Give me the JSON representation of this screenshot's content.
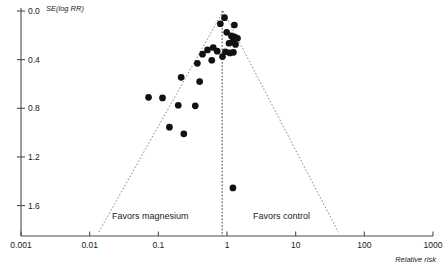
{
  "chart_data": {
    "type": "scatter",
    "title": "",
    "subtitle": "",
    "xlabel": "Relative risk",
    "ylabel": "SE(log RR)",
    "x_scale": "log",
    "xlim": [
      0.001,
      1000
    ],
    "ylim": [
      0.0,
      1.85
    ],
    "y_inverted": true,
    "grid": false,
    "legend": "none",
    "x_ticks": [
      {
        "value": 0.001,
        "label": "0.001"
      },
      {
        "value": 0.01,
        "label": "0.01"
      },
      {
        "value": 0.1,
        "label": "0.1"
      },
      {
        "value": 1,
        "label": "1"
      },
      {
        "value": 10,
        "label": "10"
      },
      {
        "value": 100,
        "label": "100"
      },
      {
        "value": 1000,
        "label": "1000"
      }
    ],
    "y_ticks": [
      {
        "value": 0.0,
        "label": "0.0"
      },
      {
        "value": 0.4,
        "label": "0.4"
      },
      {
        "value": 0.8,
        "label": "0.8"
      },
      {
        "value": 1.2,
        "label": "1.2"
      },
      {
        "value": 1.6,
        "label": "1.6"
      }
    ],
    "reference_line": {
      "name": "pooled-effect-line",
      "x": 0.85,
      "style": "dashed"
    },
    "funnel": {
      "apex_x": 0.88,
      "apex_y": 0.0,
      "left_base_x": 0.0135,
      "right_base_x": 42.0,
      "base_y": 1.82,
      "style": "dotted"
    },
    "annotations": [
      {
        "name": "favors-magnesium-label",
        "text": "Favors magnesium",
        "x_px": 112,
        "y_px": 219
      },
      {
        "name": "favors-control-label",
        "text": "Favors control",
        "x_px": 253,
        "y_px": 219
      }
    ],
    "series": [
      {
        "name": "studies",
        "marker": "filled-circle",
        "color": "#111111",
        "points": [
          {
            "x": 0.92,
            "y": 0.055
          },
          {
            "x": 0.8,
            "y": 0.105
          },
          {
            "x": 1.28,
            "y": 0.115
          },
          {
            "x": 0.99,
            "y": 0.175
          },
          {
            "x": 1.16,
            "y": 0.205
          },
          {
            "x": 1.3,
            "y": 0.215
          },
          {
            "x": 1.42,
            "y": 0.225
          },
          {
            "x": 1.2,
            "y": 0.255
          },
          {
            "x": 1.07,
            "y": 0.265
          },
          {
            "x": 1.33,
            "y": 0.275
          },
          {
            "x": 0.63,
            "y": 0.3
          },
          {
            "x": 0.52,
            "y": 0.32
          },
          {
            "x": 0.72,
            "y": 0.33
          },
          {
            "x": 0.95,
            "y": 0.335
          },
          {
            "x": 1.1,
            "y": 0.345
          },
          {
            "x": 1.24,
            "y": 0.34
          },
          {
            "x": 0.44,
            "y": 0.355
          },
          {
            "x": 0.86,
            "y": 0.375
          },
          {
            "x": 0.6,
            "y": 0.405
          },
          {
            "x": 0.37,
            "y": 0.43
          },
          {
            "x": 0.215,
            "y": 0.545
          },
          {
            "x": 0.4,
            "y": 0.58
          },
          {
            "x": 0.072,
            "y": 0.71
          },
          {
            "x": 0.115,
            "y": 0.715
          },
          {
            "x": 0.195,
            "y": 0.775
          },
          {
            "x": 0.345,
            "y": 0.78
          },
          {
            "x": 0.145,
            "y": 0.955
          },
          {
            "x": 0.235,
            "y": 1.01
          },
          {
            "x": 1.22,
            "y": 1.455
          }
        ]
      }
    ]
  }
}
